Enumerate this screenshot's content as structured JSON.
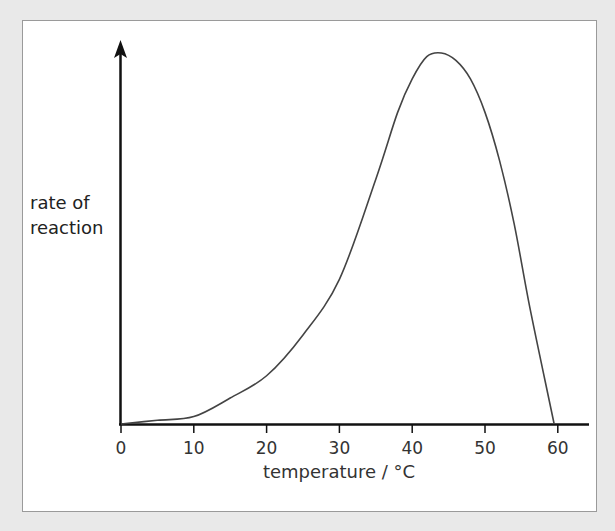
{
  "chart_data": {
    "type": "line",
    "title": "",
    "xlabel": "temperature / °C",
    "ylabel": "rate of reaction",
    "xticks": [
      0,
      10,
      20,
      30,
      40,
      50,
      60
    ],
    "xlim": [
      0,
      65
    ],
    "ylim": [
      0,
      100
    ],
    "yticks": [],
    "grid": false,
    "legend": null,
    "series": [
      {
        "name": "rate of reaction",
        "x": [
          0,
          5,
          10,
          15,
          20,
          25,
          30,
          35,
          38,
          40,
          42,
          44,
          46,
          48,
          50,
          52,
          54,
          56,
          58,
          59.5
        ],
        "y": [
          0,
          1,
          2,
          7,
          13,
          24,
          39,
          66,
          84,
          93,
          99,
          100,
          98,
          93,
          84,
          71,
          54,
          33,
          14,
          0
        ]
      }
    ],
    "annotations": [
      "curve peaks near 44 °C",
      "curve returns to zero near 60 °C"
    ]
  },
  "axes": {
    "y_label_line1": "rate of",
    "y_label_line2": "reaction",
    "x_label": "temperature / °C",
    "x_tick_labels": [
      "0",
      "10",
      "20",
      "30",
      "40",
      "50",
      "60"
    ]
  }
}
